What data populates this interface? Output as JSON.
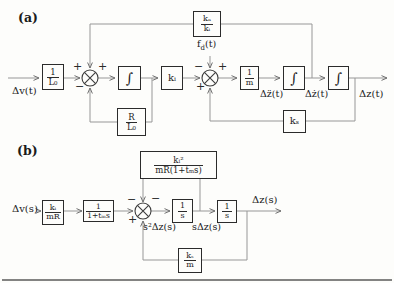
{
  "panel_a": {
    "label": "(a)",
    "input_label": "Δv(t)",
    "output_label": "Δz(t)",
    "accel_label": "Δz̈(t)",
    "vel_label": "Δż(t)",
    "disturbance": {
      "base": "f",
      "sub": "d",
      "rest": "(t)"
    },
    "blocks": {
      "inv_L0": {
        "num": "1",
        "den": "L₀"
      },
      "integrator1": "∫",
      "gain_ki": "kᵢ",
      "inv_m": {
        "num": "1",
        "den": "m"
      },
      "integrator2": "∫",
      "integrator3": "∫",
      "fb_top": {
        "num": "kₐ",
        "den": "kᵢ"
      },
      "fb_RL0": {
        "num": "R",
        "den": "L₀"
      },
      "fb_ks": "kₛ"
    },
    "sum1": {
      "sign_top_left": "+",
      "sign_top_right": "+",
      "sign_bottom_left": "−"
    },
    "sum2": {
      "sign_top_left": "−",
      "sign_top_right": "+",
      "sign_bottom_left": "+"
    }
  },
  "panel_b": {
    "label": "(b)",
    "input_label": "Δv(s)",
    "output_label": "Δz(s)",
    "accel_label": "s²Δz(s)",
    "vel_label": "sΔz(s)",
    "blocks": {
      "ki_over_mR": {
        "num": "kᵢ",
        "den": "mR"
      },
      "lag": {
        "num": "1",
        "den": "1+tₘs"
      },
      "int1": {
        "num": "1",
        "den": "s"
      },
      "int2": {
        "num": "1",
        "den": "s"
      },
      "fb_top": {
        "num": "kᵢ²",
        "den": "mR(1+tₘs)"
      },
      "fb_ks_over_m": {
        "num": "kₛ",
        "den": "m"
      }
    },
    "sum": {
      "sign_top_left": "−",
      "sign_top_right": "−",
      "sign_bottom_left": "+"
    }
  }
}
